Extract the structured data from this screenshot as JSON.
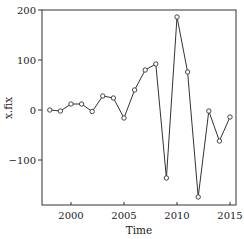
{
  "chart_data": {
    "type": "line",
    "title": "",
    "xlabel": "Time",
    "ylabel": "x.fix",
    "xlim": [
      1997.2,
      2015.7
    ],
    "ylim": [
      -190,
      200
    ],
    "xticks": [
      2000,
      2005,
      2010,
      2015
    ],
    "yticks": [
      -100,
      0,
      100,
      200
    ],
    "grid": false,
    "legend": null,
    "markers": "open-circle",
    "series": [
      {
        "name": "x.fix",
        "x": [
          1998,
          1999,
          2000,
          2001,
          2002,
          2003,
          2004,
          2005,
          2006,
          2007,
          2008,
          2009,
          2010,
          2011,
          2012,
          2013,
          2014,
          2015
        ],
        "values": [
          0,
          -2,
          12,
          12,
          -3,
          28,
          24,
          -16,
          40,
          80,
          92,
          -136,
          186,
          76,
          -174,
          -2,
          -62,
          -14
        ]
      }
    ]
  },
  "colors": {
    "line": "#333333",
    "axis": "#222222",
    "background": "#ffffff"
  }
}
